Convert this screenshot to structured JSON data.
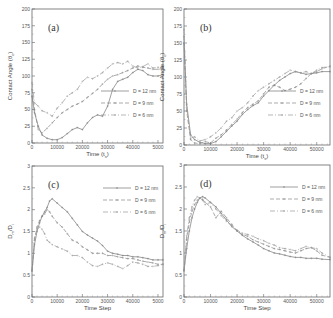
{
  "chart_data": [
    {
      "type": "line",
      "panel_label": "(a)",
      "xlabel": "Time (t_s)",
      "ylabel": "Contact Angle (θ_c)",
      "xlim": [
        0,
        52000
      ],
      "ylim": [
        0,
        200
      ],
      "xticks": [
        0,
        10000,
        20000,
        30000,
        40000,
        50000
      ],
      "xtick_labels": [
        "0",
        "10000",
        "20000",
        "30000",
        "40000",
        "5000"
      ],
      "yticks": [
        0,
        25,
        50,
        75,
        100,
        125,
        150,
        175,
        200
      ],
      "ytick_labels": [
        "0",
        "25",
        "50",
        "75",
        "100",
        "125",
        "150",
        "175",
        "200"
      ],
      "legend_position": "right-middle",
      "frame": {
        "x0": 32,
        "y0": 9,
        "x1": 163,
        "y1": 143
      },
      "series": [
        {
          "name": "D = 12 nm",
          "dash": "none",
          "marker": "plus",
          "x": [
            0,
            1000,
            2500,
            4000,
            6000,
            8000,
            10000,
            12000,
            14000,
            16000,
            18000,
            20000,
            22000,
            24000,
            26000,
            28000,
            30000,
            32000,
            34000,
            36000,
            38000,
            40000,
            42000,
            44000,
            46000,
            48000,
            50000,
            52000
          ],
          "y": [
            70,
            45,
            25,
            12,
            7,
            5,
            5,
            8,
            14,
            20,
            23,
            20,
            30,
            38,
            42,
            40,
            55,
            80,
            92,
            95,
            98,
            105,
            110,
            108,
            102,
            100,
            100,
            102
          ]
        },
        {
          "name": "D = 9 nm",
          "dash": "4,2",
          "marker": "plus",
          "x": [
            0,
            1000,
            2500,
            4000,
            6000,
            8000,
            10000,
            12000,
            14000,
            16000,
            18000,
            20000,
            22000,
            24000,
            26000,
            28000,
            30000,
            32000,
            34000,
            36000,
            38000,
            40000,
            42000,
            44000,
            46000,
            48000,
            50000,
            52000
          ],
          "y": [
            80,
            50,
            20,
            15,
            22,
            30,
            38,
            45,
            50,
            55,
            58,
            62,
            68,
            74,
            80,
            88,
            95,
            100,
            102,
            105,
            108,
            112,
            115,
            113,
            112,
            110,
            110,
            111
          ]
        },
        {
          "name": "D = 6 nm",
          "dash": "5,2,1,2",
          "marker": "plus",
          "x": [
            0,
            1000,
            2500,
            4000,
            6000,
            8000,
            10000,
            12000,
            14000,
            16000,
            18000,
            20000,
            22000,
            24000,
            26000,
            28000,
            30000,
            32000,
            34000,
            36000,
            38000,
            40000,
            42000,
            44000,
            46000,
            48000,
            50000,
            52000
          ],
          "y": [
            90,
            60,
            55,
            48,
            45,
            40,
            52,
            60,
            70,
            75,
            80,
            92,
            98,
            96,
            100,
            105,
            112,
            118,
            120,
            118,
            122,
            115,
            112,
            114,
            118,
            112,
            113,
            114
          ]
        }
      ]
    },
    {
      "type": "line",
      "panel_label": "(b)",
      "xlabel": "Time (t_s)",
      "ylabel": "Contact Angle (θ_c)",
      "xlim": [
        0,
        55000
      ],
      "ylim": [
        0,
        200
      ],
      "xticks": [
        0,
        10000,
        20000,
        30000,
        40000,
        50000
      ],
      "xtick_labels": [
        "0",
        "10000",
        "20000",
        "30000",
        "40000",
        "50000"
      ],
      "yticks": [
        0,
        25,
        50,
        75,
        100,
        125,
        150,
        175,
        200
      ],
      "ytick_labels": [
        "0",
        "25",
        "50",
        "75",
        "100",
        "125",
        "150",
        "175",
        "200"
      ],
      "legend_position": "right-middle",
      "frame": {
        "x0": 184,
        "y0": 9,
        "x1": 330,
        "y1": 145
      },
      "series": [
        {
          "name": "D = 12 nm",
          "dash": "none",
          "marker": "plus",
          "x": [
            0,
            1000,
            2500,
            4000,
            6000,
            8000,
            10000,
            12000,
            14000,
            16000,
            18000,
            20000,
            22000,
            24000,
            26000,
            28000,
            30000,
            32000,
            34000,
            36000,
            38000,
            40000,
            42000,
            44000,
            46000,
            48000,
            50000,
            52000,
            55000
          ],
          "y": [
            150,
            60,
            15,
            8,
            4,
            2,
            2,
            5,
            12,
            20,
            28,
            35,
            45,
            52,
            58,
            62,
            72,
            80,
            88,
            95,
            100,
            105,
            108,
            106,
            104,
            105,
            106,
            108,
            108
          ]
        },
        {
          "name": "D = 9 nm",
          "dash": "4,2",
          "marker": "plus",
          "x": [
            0,
            1000,
            2500,
            4000,
            6000,
            8000,
            10000,
            12000,
            14000,
            16000,
            18000,
            20000,
            22000,
            24000,
            26000,
            28000,
            30000,
            32000,
            34000,
            36000,
            38000,
            40000,
            42000,
            44000,
            46000,
            48000,
            50000,
            52000,
            55000
          ],
          "y": [
            160,
            50,
            8,
            3,
            2,
            5,
            3,
            10,
            15,
            22,
            30,
            38,
            48,
            55,
            60,
            65,
            75,
            85,
            88,
            85,
            80,
            82,
            85,
            90,
            98,
            105,
            108,
            112,
            116
          ]
        },
        {
          "name": "D = 6 nm",
          "dash": "5,2,1,2",
          "marker": "plus",
          "x": [
            0,
            1000,
            2500,
            4000,
            6000,
            8000,
            10000,
            12000,
            14000,
            16000,
            18000,
            20000,
            22000,
            24000,
            26000,
            28000,
            30000,
            32000,
            34000,
            36000,
            38000,
            40000,
            42000,
            44000,
            46000,
            48000,
            50000,
            52000,
            55000
          ],
          "y": [
            170,
            55,
            10,
            12,
            6,
            8,
            12,
            18,
            25,
            35,
            40,
            50,
            55,
            62,
            72,
            80,
            85,
            90,
            95,
            100,
            105,
            110,
            108,
            106,
            108,
            105,
            110,
            114,
            115
          ]
        }
      ]
    },
    {
      "type": "line",
      "panel_label": "(c)",
      "xlabel": "Time Step",
      "ylabel": "D_m/D_i",
      "xlim": [
        0,
        52000
      ],
      "ylim": [
        0,
        3
      ],
      "xticks": [
        0,
        10000,
        20000,
        30000,
        40000,
        50000
      ],
      "xtick_labels": [
        "0",
        "10000",
        "20000",
        "30000",
        "40000",
        "5000"
      ],
      "yticks": [
        0,
        0.5,
        1,
        1.5,
        2,
        2.5,
        3
      ],
      "ytick_labels": [
        "0",
        "0.5",
        "1",
        "1.5",
        "2",
        "2.5",
        "3"
      ],
      "legend_position": "upper-right",
      "frame": {
        "x0": 32,
        "y0": 166,
        "x1": 163,
        "y1": 297
      },
      "series": [
        {
          "name": "D = 12 nm",
          "dash": "none",
          "marker": "plus",
          "x": [
            0,
            1000,
            2000,
            3000,
            4000,
            5000,
            6000,
            7000,
            8000,
            10000,
            12000,
            14000,
            16000,
            18000,
            20000,
            22000,
            24000,
            26000,
            28000,
            30000,
            32000,
            34000,
            36000,
            38000,
            40000,
            42000,
            44000,
            46000,
            48000,
            50000,
            52000
          ],
          "y": [
            0.6,
            1.2,
            1.5,
            1.7,
            1.85,
            1.95,
            2.05,
            2.2,
            2.25,
            2.15,
            2.05,
            1.95,
            1.8,
            1.65,
            1.5,
            1.42,
            1.35,
            1.28,
            1.18,
            1.05,
            1.0,
            0.98,
            0.95,
            0.95,
            0.92,
            0.92,
            0.9,
            0.88,
            0.85,
            0.85,
            0.85
          ]
        },
        {
          "name": "D = 9 nm",
          "dash": "4,2",
          "marker": "plus",
          "x": [
            0,
            1000,
            2000,
            3000,
            4000,
            5000,
            6000,
            7000,
            8000,
            10000,
            12000,
            14000,
            16000,
            18000,
            20000,
            22000,
            24000,
            26000,
            28000,
            30000,
            32000,
            34000,
            36000,
            38000,
            40000,
            42000,
            44000,
            46000,
            48000,
            50000,
            52000
          ],
          "y": [
            0.6,
            1.3,
            1.6,
            1.75,
            1.85,
            1.9,
            2.0,
            1.95,
            1.85,
            1.7,
            1.6,
            1.45,
            1.3,
            1.25,
            1.15,
            1.08,
            1.0,
            1.0,
            1.0,
            0.95,
            0.95,
            0.92,
            0.9,
            0.88,
            0.88,
            0.85,
            0.82,
            0.8,
            0.78,
            0.75,
            0.75
          ]
        },
        {
          "name": "D = 6 nm",
          "dash": "5,2,1,2",
          "marker": "plus",
          "x": [
            0,
            1000,
            2000,
            3000,
            4000,
            5000,
            6000,
            7000,
            8000,
            10000,
            12000,
            14000,
            16000,
            18000,
            20000,
            22000,
            24000,
            26000,
            28000,
            30000,
            32000,
            34000,
            36000,
            38000,
            40000,
            42000,
            44000,
            46000,
            48000,
            50000,
            52000
          ],
          "y": [
            0.6,
            1.35,
            1.55,
            1.6,
            1.55,
            1.45,
            1.3,
            1.25,
            1.2,
            1.15,
            1.1,
            1.05,
            0.95,
            0.95,
            0.9,
            0.8,
            0.72,
            0.7,
            0.75,
            0.78,
            0.75,
            0.7,
            0.65,
            0.72,
            0.8,
            0.78,
            0.75,
            0.7,
            0.7,
            0.72,
            0.75
          ]
        }
      ]
    },
    {
      "type": "line",
      "panel_label": "(d)",
      "xlabel": "Time Step",
      "ylabel": "D_m/D_i",
      "xlim": [
        0,
        55000
      ],
      "ylim": [
        0,
        3
      ],
      "xticks": [
        0,
        10000,
        20000,
        30000,
        40000,
        50000
      ],
      "xtick_labels": [
        "0",
        "10000",
        "20000",
        "30000",
        "40000",
        "50000"
      ],
      "yticks": [
        0,
        0.5,
        1,
        1.5,
        2,
        2.5,
        3
      ],
      "ytick_labels": [
        "0",
        "0.5",
        "1",
        "1.5",
        "2",
        "2.5",
        "3"
      ],
      "legend_position": "upper-right",
      "frame": {
        "x0": 184,
        "y0": 165,
        "x1": 330,
        "y1": 297
      },
      "series": [
        {
          "name": "D = 12 nm",
          "dash": "none",
          "marker": "plus",
          "x": [
            0,
            1000,
            2000,
            3000,
            4000,
            5000,
            6000,
            7000,
            8000,
            10000,
            12000,
            14000,
            16000,
            18000,
            20000,
            22000,
            24000,
            26000,
            28000,
            30000,
            32000,
            34000,
            36000,
            38000,
            40000,
            42000,
            44000,
            46000,
            48000,
            50000,
            52000,
            55000
          ],
          "y": [
            0.6,
            1.1,
            1.5,
            1.8,
            2.0,
            2.15,
            2.25,
            2.28,
            2.25,
            2.15,
            2.05,
            1.9,
            1.75,
            1.6,
            1.5,
            1.4,
            1.32,
            1.25,
            1.18,
            1.1,
            1.05,
            1.0,
            0.98,
            0.95,
            0.92,
            0.9,
            0.9,
            0.88,
            0.88,
            0.88,
            0.86,
            0.85
          ]
        },
        {
          "name": "D = 9 nm",
          "dash": "4,2",
          "marker": "plus",
          "x": [
            0,
            1000,
            2000,
            3000,
            4000,
            5000,
            6000,
            7000,
            8000,
            10000,
            12000,
            14000,
            16000,
            18000,
            20000,
            22000,
            24000,
            26000,
            28000,
            30000,
            32000,
            34000,
            36000,
            38000,
            40000,
            42000,
            44000,
            46000,
            48000,
            50000,
            52000,
            55000
          ],
          "y": [
            0.6,
            1.3,
            1.7,
            1.95,
            2.1,
            2.2,
            2.25,
            2.22,
            2.15,
            2.05,
            1.8,
            1.95,
            1.8,
            1.65,
            1.5,
            1.42,
            1.38,
            1.3,
            1.25,
            1.2,
            1.15,
            1.1,
            1.08,
            1.05,
            1.02,
            1.0,
            1.05,
            1.1,
            1.12,
            1.05,
            0.95,
            0.9
          ]
        },
        {
          "name": "D = 6 nm",
          "dash": "5,2,1,2",
          "marker": "plus",
          "x": [
            0,
            1000,
            2000,
            3000,
            4000,
            5000,
            6000,
            7000,
            8000,
            10000,
            12000,
            14000,
            16000,
            18000,
            20000,
            22000,
            24000,
            26000,
            28000,
            30000,
            32000,
            34000,
            36000,
            38000,
            40000,
            42000,
            44000,
            46000,
            48000,
            50000,
            52000,
            55000
          ],
          "y": [
            0.6,
            1.4,
            1.8,
            2.05,
            2.2,
            2.28,
            2.25,
            2.2,
            2.1,
            2.15,
            2.0,
            1.85,
            1.72,
            1.62,
            1.52,
            1.45,
            1.42,
            1.38,
            1.32,
            1.28,
            1.22,
            1.18,
            1.12,
            1.1,
            1.08,
            1.05,
            1.1,
            1.15,
            1.12,
            1.1,
            1.0,
            0.9
          ]
        }
      ]
    }
  ]
}
